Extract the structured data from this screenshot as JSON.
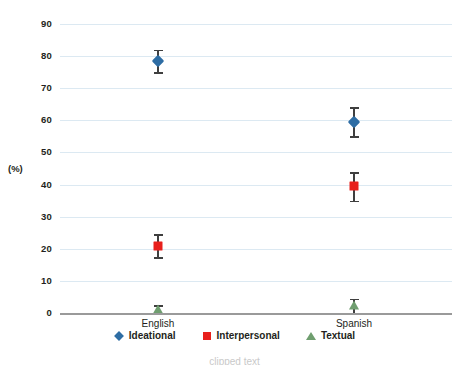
{
  "chart_data": {
    "type": "scatter",
    "title": "",
    "xlabel": "",
    "ylabel": "(%)",
    "ylim": [
      0,
      90
    ],
    "ytick_step": 10,
    "yticks": [
      90,
      80,
      70,
      60,
      50,
      40,
      30,
      20,
      10,
      0
    ],
    "grid": true,
    "legend_position": "bottom",
    "categories": [
      "English",
      "Spanish"
    ],
    "series": [
      {
        "name": "Ideational",
        "marker": "diamond",
        "color": "#2e6da4",
        "values": [
          78.5,
          59.5
        ],
        "err_low": [
          75.0,
          55.0
        ],
        "err_high": [
          82.0,
          64.0
        ]
      },
      {
        "name": "Interpersonal",
        "marker": "square",
        "color": "#e8201c",
        "values": [
          20.8,
          39.5
        ],
        "err_low": [
          17.3,
          35.0
        ],
        "err_high": [
          24.5,
          44.0
        ]
      },
      {
        "name": "Textual",
        "marker": "triangle",
        "color": "#6f9e6f",
        "values": [
          1.0,
          2.2
        ],
        "err_low": [
          0.0,
          0.0
        ],
        "err_high": [
          2.5,
          4.5
        ]
      }
    ],
    "errorbar_color": "#3f3f3f",
    "gridline_color": "#dce9f2",
    "axis_color": "#9a9a9a"
  },
  "axis": {
    "y_title": "(%)"
  },
  "caption": {
    "clipped_line": "clipped text"
  }
}
